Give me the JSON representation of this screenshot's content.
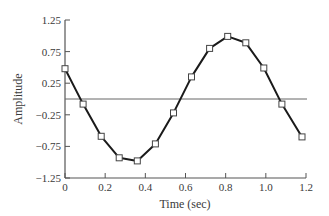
{
  "chart_data": {
    "type": "line",
    "title": "",
    "xlabel": "Time (sec)",
    "ylabel": "Amplitude",
    "xlim": [
      0,
      1.2
    ],
    "ylim": [
      -1.25,
      1.25
    ],
    "x_ticks": [
      "0",
      "0.2",
      "0.4",
      "0.6",
      "0.8",
      "1.0",
      "1.2"
    ],
    "y_ticks": [
      "1.25",
      "0.75",
      "0.25",
      "-0.25",
      "-0.75",
      "-1.25"
    ],
    "grid": false,
    "reference_line": {
      "y": 0,
      "label": "zero line"
    },
    "marker": "open-square",
    "series": [
      {
        "name": "signal",
        "color": "#1a1a1a",
        "x": [
          0.0,
          0.09,
          0.18,
          0.27,
          0.36,
          0.45,
          0.54,
          0.63,
          0.72,
          0.81,
          0.9,
          0.99,
          1.08,
          1.18
        ],
        "values": [
          0.48,
          -0.08,
          -0.59,
          -0.93,
          -0.98,
          -0.71,
          -0.22,
          0.35,
          0.8,
          0.99,
          0.89,
          0.49,
          -0.08,
          -0.6
        ]
      }
    ]
  }
}
